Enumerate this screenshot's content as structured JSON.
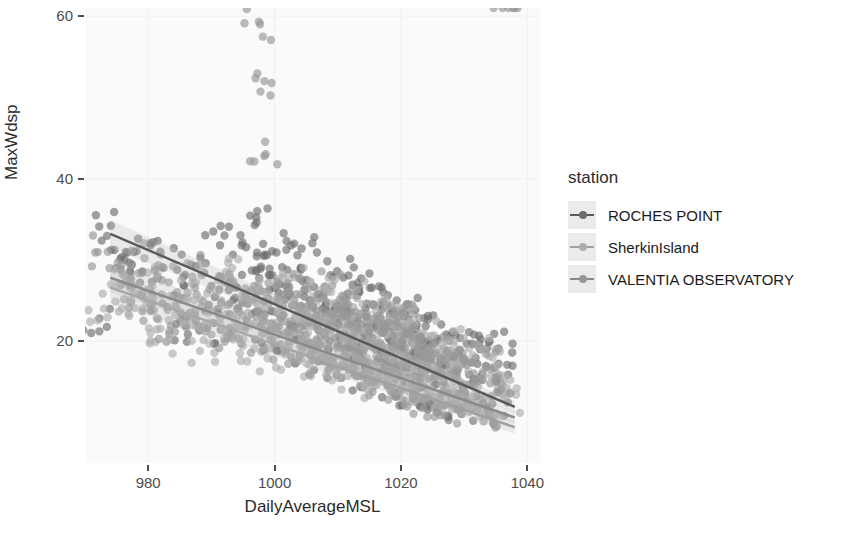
{
  "chart_data": {
    "type": "scatter",
    "title": "",
    "xlabel": "DailyAverageMSL",
    "ylabel": "MaxWdsp",
    "xlim": [
      970,
      1042
    ],
    "ylim": [
      5,
      61
    ],
    "xticks": [
      980,
      1000,
      1020,
      1040
    ],
    "yticks": [
      20,
      40,
      60
    ],
    "grid": true,
    "grid_color": "#f2f2f2",
    "panel_background": "#fafafa",
    "legend": {
      "title": "station",
      "position": "right",
      "entries": [
        {
          "label": "ROCHES POINT",
          "color": "#595959",
          "point_color": "#6e6e6e"
        },
        {
          "label": "SherkinIsland",
          "color": "#a0a0a0",
          "point_color": "#adadad"
        },
        {
          "label": "VALENTIA OBSERVATORY",
          "color": "#8a8a8a",
          "point_color": "#979797"
        }
      ]
    },
    "point_radius": 4.2,
    "point_opacity": 0.65,
    "smooth_method": "lm",
    "confidence_band_opacity": 0.28,
    "series": [
      {
        "name": "ROCHES POINT",
        "color": "#595959",
        "fit": {
          "x_start": 974.0,
          "y_start": 33.2,
          "x_end": 1038.0,
          "y_end": 11.9
        },
        "band_halfwidth_start": 1.7,
        "band_halfwidth_end": 0.7,
        "points_x": [
          972.3,
          974.1,
          975.6,
          977.2,
          978.4,
          979.0,
          980.6,
          981.9,
          983.0,
          984.4,
          985.7,
          986.8,
          988.1,
          989.0,
          990.3,
          991.4,
          992.6,
          993.5,
          994.8,
          995.6,
          996.4,
          997.1,
          997.9,
          998.3,
          998.8,
          999.2,
          999.9,
          1000.6,
          1001.2,
          1001.9,
          1002.5,
          1003.1,
          1003.8,
          1004.4,
          1005.0,
          1005.6,
          1006.1,
          1006.7,
          1007.2,
          1007.8,
          1008.3,
          1008.9,
          1009.4,
          1009.9,
          1010.4,
          1010.9,
          1011.4,
          1011.9,
          1012.3,
          1012.8,
          1013.2,
          1013.7,
          1014.1,
          1014.6,
          1015.0,
          1015.5,
          1015.9,
          1016.3,
          1016.8,
          1017.2,
          1017.6,
          1018.0,
          1018.5,
          1018.9,
          1019.3,
          1019.7,
          1020.2,
          1020.6,
          1021.0,
          1021.5,
          1021.9,
          1022.4,
          1022.8,
          1023.3,
          1023.8,
          1024.3,
          1024.8,
          1025.3,
          1025.8,
          1026.4,
          1027.0,
          1027.6,
          1028.2,
          1028.9,
          1029.6,
          1030.4,
          1031.2,
          1032.1,
          1033.0,
          1034.0,
          1035.1,
          1036.3,
          1037.6
        ],
        "points_y": [
          22.8,
          34.2,
          30.1,
          28.4,
          32.6,
          25.9,
          27.3,
          31.0,
          24.2,
          22.1,
          26.8,
          29.4,
          21.3,
          23.7,
          33.5,
          27.9,
          20.4,
          25.1,
          31.8,
          22.6,
          28.7,
          35.2,
          19.8,
          24.9,
          30.6,
          26.3,
          21.7,
          23.4,
          29.1,
          18.9,
          25.6,
          32.0,
          20.2,
          27.4,
          22.8,
          18.3,
          24.1,
          30.9,
          19.6,
          26.0,
          21.4,
          17.8,
          23.9,
          28.6,
          20.7,
          16.9,
          25.3,
          19.2,
          22.5,
          18.1,
          27.2,
          15.8,
          21.0,
          24.6,
          17.3,
          20.4,
          14.9,
          23.1,
          18.7,
          26.0,
          16.2,
          21.8,
          19.4,
          13.8,
          22.3,
          17.0,
          20.1,
          15.4,
          23.8,
          18.2,
          13.1,
          21.5,
          16.6,
          19.0,
          14.3,
          22.7,
          17.8,
          12.6,
          20.3,
          15.9,
          18.4,
          13.5,
          21.1,
          16.3,
          11.9,
          19.7,
          14.8,
          17.2,
          12.4,
          20.0,
          15.1,
          10.8,
          18.6,
          13.2
        ]
      },
      {
        "name": "SherkinIsland",
        "color": "#a0a0a0",
        "fit": {
          "x_start": 974.0,
          "y_start": 26.6,
          "x_end": 1038.0,
          "y_end": 9.4
        },
        "band_halfwidth_start": 1.9,
        "band_halfwidth_end": 0.8,
        "points_x": [
          973.0,
          975.2,
          977.0,
          978.8,
          980.1,
          981.5,
          982.9,
          984.2,
          985.5,
          986.9,
          988.2,
          989.5,
          990.8,
          992.0,
          993.3,
          994.5,
          995.7,
          996.8,
          997.6,
          998.2,
          998.9,
          999.5,
          1000.2,
          1000.9,
          1001.6,
          1002.3,
          1003.0,
          1003.6,
          1004.3,
          1004.9,
          1005.5,
          1006.1,
          1006.7,
          1007.3,
          1007.9,
          1008.5,
          1009.0,
          1009.6,
          1010.1,
          1010.6,
          1011.1,
          1011.6,
          1012.1,
          1012.6,
          1013.1,
          1013.6,
          1014.0,
          1014.5,
          1014.9,
          1015.4,
          1015.8,
          1016.2,
          1016.7,
          1017.1,
          1017.5,
          1018.0,
          1018.4,
          1018.8,
          1019.2,
          1019.7,
          1020.1,
          1020.5,
          1021.0,
          1021.4,
          1021.9,
          1022.3,
          1022.8,
          1023.2,
          1023.7,
          1024.2,
          1024.7,
          1025.2,
          1025.7,
          1026.2,
          1026.8,
          1027.3,
          1027.9,
          1028.5,
          1029.2,
          1029.9,
          1030.6,
          1031.4,
          1032.2,
          1033.1,
          1034.1,
          1035.2,
          1036.4,
          1037.3
        ],
        "points_y": [
          24.0,
          26.9,
          23.1,
          25.8,
          21.6,
          28.2,
          19.9,
          24.4,
          22.0,
          27.1,
          18.8,
          23.5,
          25.9,
          20.3,
          29.0,
          21.8,
          24.8,
          19.1,
          26.5,
          22.4,
          17.9,
          25.0,
          20.7,
          23.6,
          18.4,
          27.7,
          21.2,
          24.3,
          19.6,
          22.9,
          17.1,
          25.5,
          20.0,
          23.2,
          18.0,
          26.1,
          21.4,
          16.5,
          24.0,
          19.3,
          22.1,
          17.4,
          25.7,
          20.6,
          15.9,
          23.4,
          18.7,
          21.3,
          16.1,
          24.5,
          19.8,
          14.7,
          22.6,
          17.6,
          20.9,
          15.3,
          23.0,
          18.1,
          21.7,
          16.8,
          13.9,
          20.2,
          17.3,
          22.4,
          15.0,
          19.5,
          13.2,
          21.0,
          16.4,
          18.9,
          14.1,
          20.7,
          17.0,
          12.5,
          19.1,
          15.6,
          18.3,
          13.7,
          16.9,
          20.4,
          12.1,
          17.5,
          14.4,
          19.0,
          11.6,
          16.0,
          13.0,
          15.2,
          10.9
        ]
      },
      {
        "name": "VALENTIA OBSERVATORY",
        "color": "#8a8a8a",
        "fit": {
          "x_start": 974.0,
          "y_start": 27.8,
          "x_end": 1038.0,
          "y_end": 10.6
        },
        "band_halfwidth_start": 1.8,
        "band_halfwidth_end": 0.75,
        "points_x": [
          973.6,
          975.9,
          977.8,
          979.4,
          980.9,
          982.2,
          983.6,
          984.9,
          986.2,
          987.5,
          988.7,
          990.0,
          991.2,
          992.4,
          993.6,
          994.7,
          995.9,
          996.9,
          997.7,
          998.4,
          998.6,
          999.0,
          999.6,
          1000.3,
          1001.0,
          1001.7,
          1002.4,
          1003.0,
          1003.7,
          1004.3,
          1004.9,
          1005.5,
          1006.1,
          1006.6,
          1007.2,
          1007.7,
          1008.3,
          1008.8,
          1009.3,
          1009.8,
          1010.3,
          1010.8,
          1011.3,
          1011.8,
          1012.2,
          1012.7,
          1013.2,
          1013.6,
          1014.1,
          1014.5,
          1015.0,
          1015.4,
          1015.8,
          1016.3,
          1016.7,
          1017.1,
          1017.5,
          1018.0,
          1018.4,
          1018.8,
          1019.3,
          1019.7,
          1020.1,
          1020.6,
          1021.0,
          1021.5,
          1022.0,
          1022.5,
          1023.0,
          1023.5,
          1024.0,
          1024.5,
          1025.0,
          1025.6,
          1026.1,
          1026.7,
          1027.3,
          1027.9,
          1028.6,
          1029.3,
          1030.0,
          1030.8,
          1031.6,
          1032.5,
          1033.5,
          1034.6,
          1035.8,
          1037.0
        ],
        "points_y": [
          31.0,
          28.3,
          26.0,
          30.2,
          23.8,
          27.5,
          21.9,
          25.4,
          29.6,
          22.7,
          24.9,
          20.8,
          28.0,
          23.3,
          26.7,
          19.7,
          25.1,
          22.2,
          59.0,
          52.0,
          43.0,
          24.6,
          20.1,
          27.3,
          22.8,
          18.6,
          25.9,
          21.5,
          24.1,
          19.0,
          26.8,
          22.3,
          17.7,
          23.7,
          20.5,
          25.2,
          18.3,
          22.0,
          16.9,
          24.3,
          20.9,
          17.2,
          23.1,
          19.4,
          26.2,
          15.8,
          21.6,
          18.0,
          23.5,
          16.3,
          20.2,
          14.9,
          22.8,
          17.5,
          19.8,
          15.1,
          21.9,
          18.4,
          13.8,
          20.6,
          16.7,
          23.0,
          14.2,
          19.2,
          17.0,
          21.3,
          12.9,
          18.1,
          15.4,
          20.0,
          13.3,
          16.5,
          19.6,
          11.8,
          17.3,
          14.6,
          18.8,
          12.2,
          16.0,
          13.6,
          17.9,
          11.3,
          15.2,
          12.8,
          16.8,
          10.5,
          14.0
        ]
      }
    ]
  }
}
